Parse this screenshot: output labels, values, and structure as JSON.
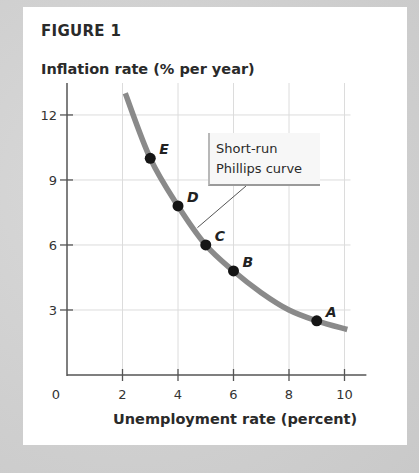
{
  "figure": {
    "title": "FIGURE 1"
  },
  "chart_data": {
    "type": "line",
    "title": "FIGURE 1",
    "xlabel": "Unemployment rate (percent)",
    "ylabel": "Inflation rate (% per year)",
    "xlim": [
      0,
      10.5
    ],
    "ylim": [
      0,
      13.5
    ],
    "x_ticks": [
      0,
      2,
      4,
      6,
      8,
      10
    ],
    "x_tick_labels": [
      "0",
      "2",
      "4",
      "6",
      "8",
      "10"
    ],
    "y_ticks": [
      3,
      6,
      9,
      12
    ],
    "y_tick_labels": [
      "3",
      "6",
      "9",
      "12"
    ],
    "grid": true,
    "series": [
      {
        "name": "Short-run Phillips curve",
        "color": "#8a8a8a",
        "curve": [
          {
            "x": 2.1,
            "y": 13.0
          },
          {
            "x": 3,
            "y": 10.0
          },
          {
            "x": 4,
            "y": 7.8
          },
          {
            "x": 5,
            "y": 6.0
          },
          {
            "x": 6,
            "y": 4.8
          },
          {
            "x": 7,
            "y": 3.8
          },
          {
            "x": 8,
            "y": 3.0
          },
          {
            "x": 9,
            "y": 2.5
          },
          {
            "x": 10.1,
            "y": 2.1
          }
        ]
      }
    ],
    "points": [
      {
        "label": "A",
        "x": 9,
        "y": 2.5
      },
      {
        "label": "B",
        "x": 6,
        "y": 4.8
      },
      {
        "label": "C",
        "x": 5,
        "y": 6.0
      },
      {
        "label": "D",
        "x": 4,
        "y": 7.8
      },
      {
        "label": "E",
        "x": 3,
        "y": 10.0
      }
    ],
    "annotations": [
      {
        "text": "Short-run Phillips curve",
        "lines": [
          "Short-run",
          "Phillips curve"
        ],
        "points_to": {
          "x": 4.7,
          "y": 6.8
        }
      }
    ],
    "legend": "none"
  },
  "colors": {
    "curve": "#8a8a8a",
    "points": "#151515",
    "axis": "#555555",
    "grid": "#dcdcdc",
    "panel": "#ffffff",
    "background": "#d2d2d2"
  }
}
